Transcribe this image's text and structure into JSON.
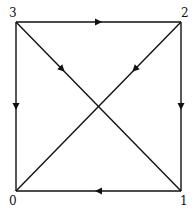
{
  "diagram": {
    "type": "directed-graph",
    "nodes": [
      {
        "id": "0",
        "label": "0",
        "x": 16,
        "y": 191,
        "lx": 9,
        "ly": 205
      },
      {
        "id": "1",
        "label": "1",
        "x": 181,
        "y": 191,
        "lx": 180,
        "ly": 205
      },
      {
        "id": "2",
        "label": "2",
        "x": 181,
        "y": 22,
        "lx": 181,
        "ly": 17
      },
      {
        "id": "3",
        "label": "3",
        "x": 16,
        "y": 22,
        "lx": 9,
        "ly": 17
      }
    ],
    "edges": [
      {
        "from": "3",
        "to": "2"
      },
      {
        "from": "2",
        "to": "1"
      },
      {
        "from": "1",
        "to": "0"
      },
      {
        "from": "3",
        "to": "0"
      },
      {
        "from": "3",
        "to": "1"
      },
      {
        "from": "2",
        "to": "0"
      }
    ],
    "colors": {
      "stroke": "#111111",
      "background": "#ffffff"
    }
  }
}
